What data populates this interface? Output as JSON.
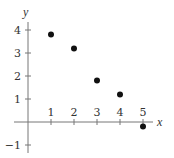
{
  "chart_data": {
    "type": "scatter",
    "title": "",
    "xlabel": "x",
    "ylabel": "y",
    "x": [
      1,
      2,
      3,
      4,
      5
    ],
    "y": [
      3.8,
      3.2,
      1.8,
      1.2,
      -0.2
    ],
    "points": [
      {
        "x": 1,
        "y": 3.8
      },
      {
        "x": 2,
        "y": 3.2
      },
      {
        "x": 3,
        "y": 1.8
      },
      {
        "x": 4,
        "y": 1.2
      },
      {
        "x": 5,
        "y": -0.2
      }
    ],
    "xticks": [
      1,
      2,
      3,
      4,
      5
    ],
    "xtick_labels": [
      "1",
      "2",
      "3",
      "4",
      "5"
    ],
    "yticks": [
      -1,
      1,
      2,
      3,
      4
    ],
    "ytick_labels": [
      "−1",
      "1",
      "2",
      "3",
      "4"
    ],
    "xlim": [
      0,
      5.3
    ],
    "ylim": [
      -1.3,
      4.3
    ],
    "grid": false,
    "legend": null,
    "marker_color": "#111111",
    "axis_color": "#777777"
  },
  "layout": {
    "origin_px": [
      28,
      122
    ],
    "unit_px": 23,
    "x_axis_end_px": 153,
    "y_axis_top_px": 22,
    "y_axis_bottom_px": 153
  }
}
